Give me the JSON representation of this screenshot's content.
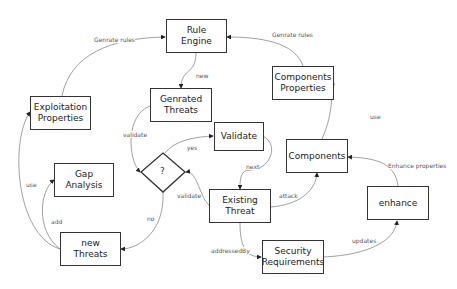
{
  "nodes": {
    "rule_engine": "Rule\nEngine",
    "exploitation_properties": "Exploitation\nProperties",
    "genrated_threats": "Genrated\nThreats",
    "components_properties": "Components\nProperties",
    "validate": "Validate",
    "components": "Components",
    "decision": "?",
    "gap_analysis": "Gap Analysis",
    "existing_threat": "Existing\nThreat",
    "enhance": "enhance",
    "new_threats": "new\nThreats",
    "security_requirements": "Security\nRequirements"
  },
  "edges": {
    "genrate_rules_left": "Genrate rules",
    "genrate_rules_right": "Genrate rules",
    "new": "new",
    "validate_left": "validate",
    "yes": "yes",
    "next": "next",
    "use_right": "use",
    "enhance_properties": "Enhance properties",
    "attack": "attack",
    "validate_right": "validate",
    "use_left": "use",
    "add": "add",
    "no": "no",
    "addressed_by": "addressedBy",
    "updates": "updates"
  }
}
